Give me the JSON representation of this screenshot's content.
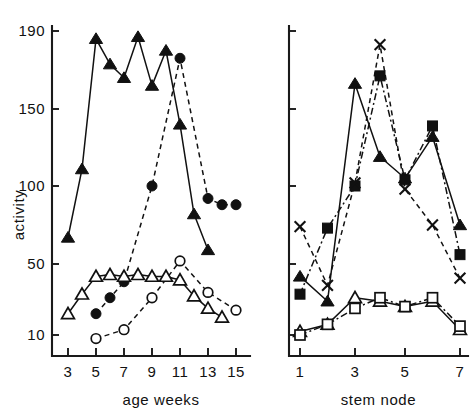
{
  "figure": {
    "background": "#ffffff",
    "ink_color": "#111111",
    "ylabel": "activity"
  },
  "chart_data": [
    {
      "type": "line",
      "panel": "left",
      "title": "",
      "xlabel": "age  weeks",
      "ylabel": "activity",
      "xlim": [
        2,
        16
      ],
      "ylim": [
        0,
        200
      ],
      "xticks": [
        3,
        5,
        7,
        9,
        11,
        13,
        15
      ],
      "xticklabels": [
        "3",
        "5",
        "7",
        "9",
        "11",
        "13",
        "15"
      ],
      "yticks": [
        10,
        50,
        100,
        150,
        190
      ],
      "yticklabels": [
        "10",
        "50",
        "100",
        "150",
        "190"
      ],
      "grid": false,
      "legend": "none",
      "series": [
        {
          "name": "filled-triangle",
          "marker": "filled-triangle",
          "linestyle": "solid",
          "x": [
            3,
            4,
            5,
            6,
            7,
            8,
            9,
            10,
            11,
            12,
            13
          ],
          "values": [
            67,
            111,
            186,
            173,
            166,
            187,
            162,
            180,
            140,
            82,
            59
          ]
        },
        {
          "name": "filled-circle",
          "marker": "filled-circle",
          "linestyle": "dashed",
          "x": [
            5,
            6,
            7,
            9,
            11,
            13,
            14,
            15
          ],
          "values": [
            22,
            31,
            40,
            100,
            176,
            92,
            88,
            88
          ]
        },
        {
          "name": "open-triangle",
          "marker": "open-triangle",
          "linestyle": "solid",
          "x": [
            3,
            4,
            5,
            6,
            7,
            8,
            9,
            10,
            11,
            12,
            13,
            14
          ],
          "values": [
            22,
            33,
            43,
            44,
            43,
            44,
            43,
            43,
            41,
            32,
            25,
            20
          ]
        },
        {
          "name": "open-circle",
          "marker": "open-circle",
          "linestyle": "dashed",
          "x": [
            5,
            7,
            9,
            11,
            13,
            15
          ],
          "values": [
            8,
            13,
            31,
            52,
            34,
            24
          ]
        }
      ]
    },
    {
      "type": "line",
      "panel": "right",
      "title": "",
      "xlabel": "stem  node",
      "ylabel": "",
      "xlim": [
        0.5,
        7.5
      ],
      "ylim": [
        0,
        200
      ],
      "xticks": [
        1,
        3,
        5,
        7
      ],
      "xticklabels": [
        "1",
        "3",
        "5",
        "7"
      ],
      "yticks": [
        10,
        50,
        100,
        150,
        190
      ],
      "yticklabels": [
        "",
        "",
        "",
        "",
        ""
      ],
      "grid": false,
      "legend": "none",
      "series": [
        {
          "name": "filled-triangle",
          "marker": "filled-triangle",
          "linestyle": "solid",
          "x": [
            1,
            2,
            3,
            4,
            5,
            6,
            7
          ],
          "values": [
            43,
            29,
            163,
            119,
            105,
            132,
            75
          ]
        },
        {
          "name": "filled-square",
          "marker": "filled-square",
          "linestyle": "dashdot",
          "x": [
            1,
            2,
            3,
            4,
            5,
            6,
            7
          ],
          "values": [
            33,
            73,
            100,
            167,
            104,
            139,
            56
          ]
        },
        {
          "name": "cross",
          "marker": "cross",
          "linestyle": "dashed",
          "x": [
            1,
            2,
            3,
            4,
            5,
            6,
            7
          ],
          "values": [
            74,
            38,
            102,
            183,
            98,
            75,
            42
          ]
        },
        {
          "name": "open-triangle",
          "marker": "open-triangle",
          "linestyle": "solid",
          "x": [
            1,
            2,
            3,
            4,
            5,
            6,
            7
          ],
          "values": [
            12,
            16,
            31,
            29,
            26,
            29,
            13
          ]
        },
        {
          "name": "open-square",
          "marker": "open-square",
          "linestyle": "dashdot",
          "x": [
            1,
            2,
            3,
            4,
            5,
            6,
            7
          ],
          "values": [
            10,
            16,
            25,
            31,
            26,
            31,
            15
          ]
        }
      ]
    }
  ]
}
